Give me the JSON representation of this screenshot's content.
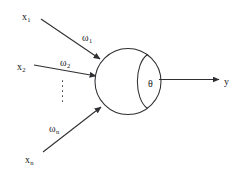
{
  "diagram": {
    "type": "neuron-schematic",
    "canvas": {
      "width": 246,
      "height": 172,
      "background": "#ffffff"
    },
    "stroke_color": "#2e2e33",
    "text_color": "#17171a",
    "inputs": [
      {
        "id": "x1",
        "base": "x",
        "subscript": "1"
      },
      {
        "id": "x2",
        "base": "x",
        "subscript": "2"
      },
      {
        "id": "xn",
        "base": "x",
        "subscript": "n"
      }
    ],
    "weights": [
      {
        "id": "w1",
        "base": "ω",
        "subscript": "1"
      },
      {
        "id": "w2",
        "base": "ω",
        "subscript": "2"
      },
      {
        "id": "wn",
        "base": "ω",
        "subscript": "n"
      }
    ],
    "threshold": {
      "id": "theta",
      "base": "θ"
    },
    "output": {
      "id": "y",
      "base": "y"
    },
    "ellipsis": {
      "dots": 5,
      "orientation": "vertical"
    }
  }
}
